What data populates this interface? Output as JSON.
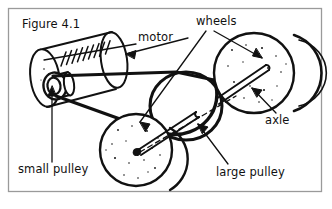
{
  "figure": {
    "title": "Figure 4.1",
    "border_color": "#9a9a9a",
    "ink_color": "#111111",
    "background": "#ffffff"
  },
  "labels": [
    {
      "id": "motor",
      "text": "motor",
      "x": 138,
      "y": 41,
      "anchor": "start"
    },
    {
      "id": "wheels",
      "text": "wheels",
      "x": 196,
      "y": 25,
      "anchor": "start"
    },
    {
      "id": "axle",
      "text": "axle",
      "x": 265,
      "y": 124,
      "anchor": "start"
    },
    {
      "id": "large-pulley",
      "text": "large pulley",
      "x": 216,
      "y": 176,
      "anchor": "start"
    },
    {
      "id": "small-pulley",
      "text": "small pulley",
      "x": 18,
      "y": 173,
      "anchor": "start"
    }
  ],
  "parts": [
    {
      "id": "motor",
      "name": "motor",
      "kind": "cylinder"
    },
    {
      "id": "small-pulley",
      "name": "small pulley",
      "kind": "pulley"
    },
    {
      "id": "large-pulley",
      "name": "large pulley",
      "kind": "pulley"
    },
    {
      "id": "wheel-top",
      "name": "top right wheel",
      "kind": "wheel"
    },
    {
      "id": "wheel-bottom",
      "name": "bottom wheel",
      "kind": "wheel"
    },
    {
      "id": "axle",
      "name": "axle",
      "kind": "rod"
    },
    {
      "id": "belt",
      "name": "drive belt",
      "kind": "belt"
    }
  ],
  "cutoff_text": "                                                                                  "
}
